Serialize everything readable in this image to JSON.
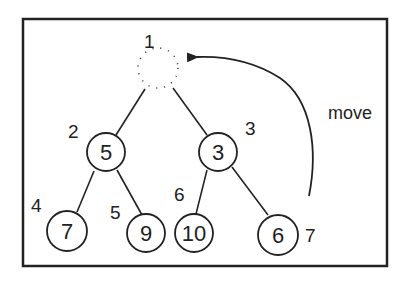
{
  "diagram": {
    "type": "binary-heap-tree",
    "caption_move": "move",
    "root": {
      "index_label": "1",
      "value": "",
      "state": "empty"
    },
    "nodes": [
      {
        "index_label": "2",
        "value": "5"
      },
      {
        "index_label": "3",
        "value": "3"
      },
      {
        "index_label": "4",
        "value": "7"
      },
      {
        "index_label": "5",
        "value": "9"
      },
      {
        "index_label": "6",
        "value": "10"
      },
      {
        "index_label": "7",
        "value": "6"
      }
    ],
    "edges": [
      [
        "1",
        "2"
      ],
      [
        "1",
        "3"
      ],
      [
        "2",
        "4"
      ],
      [
        "2",
        "5"
      ],
      [
        "3",
        "6"
      ],
      [
        "3",
        "7"
      ]
    ],
    "arrow": {
      "from": "7",
      "to": "1",
      "label": "move"
    }
  }
}
